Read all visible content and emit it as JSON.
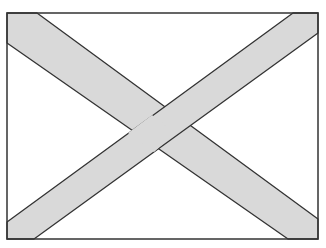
{
  "diagram": {
    "type": "saltire-flag",
    "colors": {
      "field": "#ffffff",
      "band": "#d9d9d9",
      "outline": "#333333"
    },
    "frame": {
      "x": 7,
      "y": 13,
      "width": 311,
      "height": 226
    },
    "bands": [
      {
        "name": "diagonal-top-left-to-bottom-right",
        "points": "7,13 7,43 288,239 318,239 318,219 37,13"
      },
      {
        "name": "diagonal-top-right-to-bottom-left",
        "points": "293,13 318,13 318,33 34,239 7,239 7,222"
      }
    ]
  }
}
